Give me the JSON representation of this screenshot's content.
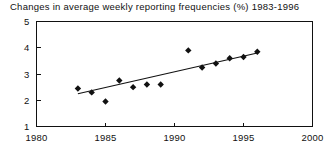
{
  "chart_data": {
    "type": "scatter",
    "title": "Changes in average weekly reporting frequencies (%) 1983-1996",
    "xlabel": "",
    "ylabel": "",
    "xlim": [
      1980,
      2000
    ],
    "ylim": [
      1,
      5
    ],
    "xticks": [
      1980,
      1985,
      1990,
      1995,
      2000
    ],
    "yticks": [
      1,
      2,
      3,
      4,
      5
    ],
    "xtick_labels": [
      "1980",
      "1985",
      "1990",
      "1995",
      "2000"
    ],
    "ytick_labels": [
      "1",
      "2",
      "3",
      "4",
      "5"
    ],
    "grid": false,
    "legend": false,
    "marker": "diamond",
    "marker_color": "#111111",
    "line_color": "#111111",
    "x": [
      1983,
      1984,
      1985,
      1986,
      1987,
      1988,
      1989,
      1991,
      1992,
      1993,
      1994,
      1995,
      1996
    ],
    "y": [
      2.45,
      2.3,
      1.95,
      2.75,
      2.5,
      2.6,
      2.6,
      3.9,
      3.25,
      3.4,
      3.6,
      3.65,
      3.85
    ],
    "series": [
      {
        "name": "observations",
        "type": "scatter",
        "points": [
          {
            "x": 1983,
            "y": 2.45
          },
          {
            "x": 1984,
            "y": 2.3
          },
          {
            "x": 1985,
            "y": 1.95
          },
          {
            "x": 1986,
            "y": 2.75
          },
          {
            "x": 1987,
            "y": 2.5
          },
          {
            "x": 1988,
            "y": 2.6
          },
          {
            "x": 1989,
            "y": 2.6
          },
          {
            "x": 1991,
            "y": 3.9
          },
          {
            "x": 1992,
            "y": 3.25
          },
          {
            "x": 1993,
            "y": 3.4
          },
          {
            "x": 1994,
            "y": 3.6
          },
          {
            "x": 1995,
            "y": 3.65
          },
          {
            "x": 1996,
            "y": 3.85
          }
        ]
      },
      {
        "name": "trend-line",
        "type": "line",
        "points": [
          {
            "x": 1983,
            "y": 2.25
          },
          {
            "x": 1996,
            "y": 3.8
          }
        ]
      }
    ]
  },
  "figure": {
    "title": "Changes in average weekly reporting frequencies (%) 1983-1996"
  }
}
